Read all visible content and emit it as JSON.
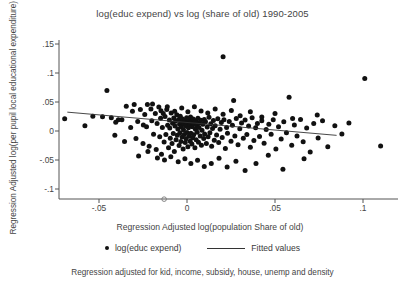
{
  "chart_data": {
    "type": "scatter",
    "title": "log(educ expend) vs log (share of old) 1990-2005",
    "xlabel": "Regression Adjusted log(population Share of old)",
    "ylabel": "Regression Adjusted log(per pupil local educational expenditure)",
    "footnote": "Regression adjusted for kid, income, subsidy, house, unemp and density",
    "xlim": [
      -0.075,
      0.118
    ],
    "ylim": [
      -0.118,
      0.155
    ],
    "xticks": [
      -0.05,
      0,
      0.05,
      0.1
    ],
    "xticklabels": [
      "-.05",
      "0",
      ".05",
      ".1"
    ],
    "yticks": [
      -0.1,
      -0.05,
      0,
      0.05,
      0.1,
      0.15
    ],
    "yticklabels": [
      "-.1",
      "-.05",
      "0",
      ".05",
      ".1",
      ".15"
    ],
    "grid": false,
    "legend_position": "below-axes",
    "marker_color": "#111111",
    "line_color": "#333333",
    "series": [
      {
        "name": "log(educ expend)",
        "marker": "filled-circle",
        "points": [
          [
            -0.0695,
            0.021
          ],
          [
            -0.058,
            0.009
          ],
          [
            -0.0535,
            0.0255
          ],
          [
            -0.048,
            0.0245
          ],
          [
            -0.0455,
            0.07
          ],
          [
            -0.043,
            0.023
          ],
          [
            -0.0405,
            0.015
          ],
          [
            -0.039,
            0.0195
          ],
          [
            -0.037,
            0.0195
          ],
          [
            -0.0345,
            0.0425
          ],
          [
            -0.032,
            0.006
          ],
          [
            -0.03,
            0.0455
          ],
          [
            -0.029,
            -0.013
          ],
          [
            -0.028,
            0.0165
          ],
          [
            -0.0265,
            0.037
          ],
          [
            -0.025,
            -0.0215
          ],
          [
            -0.024,
            0.0285
          ],
          [
            -0.023,
            0.0075
          ],
          [
            -0.0225,
            0.0455
          ],
          [
            -0.0215,
            -0.0265
          ],
          [
            -0.0205,
            0.038
          ],
          [
            -0.02,
            0.0175
          ],
          [
            -0.019,
            -0.0055
          ],
          [
            -0.018,
            0.03
          ],
          [
            -0.0175,
            -0.032
          ],
          [
            -0.017,
            0.013
          ],
          [
            -0.016,
            0.0415
          ],
          [
            -0.0155,
            -0.01
          ],
          [
            -0.015,
            0.022
          ],
          [
            -0.0145,
            -0.04
          ],
          [
            -0.014,
            0.006
          ],
          [
            -0.0135,
            0.03
          ],
          [
            -0.013,
            -0.019
          ],
          [
            -0.0125,
            0.025
          ],
          [
            -0.012,
            -0.006
          ],
          [
            -0.0115,
            0.037
          ],
          [
            -0.011,
            0.01
          ],
          [
            -0.0105,
            -0.029
          ],
          [
            -0.01,
            0.019
          ],
          [
            -0.0098,
            0.005
          ],
          [
            -0.0095,
            -0.0125
          ],
          [
            -0.009,
            0.031
          ],
          [
            -0.0085,
            -0.0215
          ],
          [
            -0.0082,
            0.0135
          ],
          [
            -0.0078,
            -0.0045
          ],
          [
            -0.0075,
            0.0225
          ],
          [
            -0.0072,
            -0.0355
          ],
          [
            -0.0068,
            0.0085
          ],
          [
            -0.0065,
            0.017
          ],
          [
            -0.0062,
            -0.015
          ],
          [
            -0.0058,
            0.028
          ],
          [
            -0.0055,
            -0.0075
          ],
          [
            -0.0052,
            0.0035
          ],
          [
            -0.0048,
            0.02
          ],
          [
            -0.0045,
            -0.025
          ],
          [
            -0.0042,
            0.0115
          ],
          [
            -0.004,
            -0.003
          ],
          [
            -0.0038,
            0.0255
          ],
          [
            -0.0035,
            -0.018
          ],
          [
            -0.0032,
            0.007
          ],
          [
            -0.003,
            0.016
          ],
          [
            -0.0028,
            -0.0105
          ],
          [
            -0.0025,
            0.0205
          ],
          [
            -0.0022,
            -0.031
          ],
          [
            -0.002,
            0.002
          ],
          [
            -0.0018,
            0.0125
          ],
          [
            -0.0015,
            -0.006
          ],
          [
            -0.0012,
            0.018
          ],
          [
            -0.001,
            -0.02
          ],
          [
            -0.0008,
            0.009
          ],
          [
            -0.0005,
            -0.0135
          ],
          [
            -0.0002,
            0.023
          ],
          [
            0.0,
            -0.0025
          ],
          [
            0.0002,
            0.0145
          ],
          [
            0.0005,
            -0.027
          ],
          [
            0.0008,
            0.0055
          ],
          [
            0.001,
            0.0195
          ],
          [
            0.0012,
            -0.009
          ],
          [
            0.0015,
            0.011
          ],
          [
            0.0018,
            -0.0175
          ],
          [
            0.002,
            0.024
          ],
          [
            0.0022,
            -0.004
          ],
          [
            0.0025,
            0.016
          ],
          [
            0.0028,
            -0.0225
          ],
          [
            0.003,
            0.0075
          ],
          [
            0.0032,
            -0.0115
          ],
          [
            0.0035,
            0.0205
          ],
          [
            0.0038,
            -0.0065
          ],
          [
            0.004,
            0.013
          ],
          [
            0.0045,
            -0.029
          ],
          [
            0.0048,
            0.003
          ],
          [
            0.005,
            0.0175
          ],
          [
            0.0052,
            -0.015
          ],
          [
            0.0055,
            0.0095
          ],
          [
            0.0058,
            -0.002
          ],
          [
            0.0062,
            0.022
          ],
          [
            0.0065,
            -0.0195
          ],
          [
            0.0068,
            0.006
          ],
          [
            0.007,
            0.014
          ],
          [
            0.0075,
            -0.0085
          ],
          [
            0.0078,
            0.0185
          ],
          [
            0.0082,
            -0.0245
          ],
          [
            0.0085,
            0.0015
          ],
          [
            0.009,
            0.0115
          ],
          [
            0.0095,
            -0.013
          ],
          [
            0.0098,
            0.02
          ],
          [
            0.01,
            -0.005
          ],
          [
            0.0105,
            0.016
          ],
          [
            0.011,
            -0.0215
          ],
          [
            0.0115,
            0.007
          ],
          [
            0.012,
            -0.01
          ],
          [
            0.0125,
            0.0235
          ],
          [
            0.013,
            -0.003
          ],
          [
            0.0135,
            0.0125
          ],
          [
            0.014,
            -0.0265
          ],
          [
            0.0145,
            0.0045
          ],
          [
            0.015,
            0.018
          ],
          [
            0.0155,
            -0.016
          ],
          [
            0.016,
            0.009
          ],
          [
            0.0168,
            -0.007
          ],
          [
            0.0175,
            0.021
          ],
          [
            0.018,
            -0.02
          ],
          [
            0.0188,
            0.003
          ],
          [
            0.0195,
            0.0145
          ],
          [
            0.02,
            -0.011
          ],
          [
            0.0205,
            0.128
          ],
          [
            0.021,
            0.0195
          ],
          [
            0.0218,
            -0.03
          ],
          [
            0.0225,
            0.006
          ],
          [
            0.023,
            -0.004
          ],
          [
            0.024,
            0.0165
          ],
          [
            0.025,
            -0.0175
          ],
          [
            0.0258,
            0.01
          ],
          [
            0.0265,
            0.0525
          ],
          [
            0.0272,
            -0.0085
          ],
          [
            0.028,
            0.0215
          ],
          [
            0.029,
            -0.0235
          ],
          [
            0.03,
            0.004
          ],
          [
            0.031,
            0.014
          ],
          [
            0.032,
            -0.0125
          ],
          [
            0.033,
            0.019
          ],
          [
            0.034,
            -0.006
          ],
          [
            0.035,
            0.0085
          ],
          [
            0.036,
            -0.028
          ],
          [
            0.037,
            0.023
          ],
          [
            0.038,
            -0.0165
          ],
          [
            0.039,
            0.0055
          ],
          [
            0.04,
            0.013
          ],
          [
            0.0412,
            -0.0095
          ],
          [
            0.0425,
            0.0175
          ],
          [
            0.0438,
            -0.021
          ],
          [
            0.045,
            0.0025
          ],
          [
            0.0465,
            0.0115
          ],
          [
            0.0478,
            -0.0055
          ],
          [
            0.049,
            0.0195
          ],
          [
            0.0505,
            -0.031
          ],
          [
            0.052,
            0.0075
          ],
          [
            0.0535,
            -0.014
          ],
          [
            0.055,
            0.016
          ],
          [
            0.0565,
            -0.003
          ],
          [
            0.058,
            0.058
          ],
          [
            0.0595,
            -0.0245
          ],
          [
            0.061,
            0.0105
          ],
          [
            0.0625,
            -0.0085
          ],
          [
            0.0645,
            0.02
          ],
          [
            0.066,
            -0.0185
          ],
          [
            0.068,
            0.005
          ],
          [
            0.07,
            -0.036
          ],
          [
            0.072,
            0.013
          ],
          [
            0.0745,
            -0.012
          ],
          [
            0.077,
            0.0175
          ],
          [
            0.08,
            -0.027
          ],
          [
            0.084,
            0.009
          ],
          [
            0.088,
            -0.005
          ],
          [
            0.092,
            0.014
          ],
          [
            0.101,
            0.0905
          ],
          [
            0.11,
            -0.026
          ],
          [
            -0.041,
            -0.0075
          ],
          [
            -0.0355,
            -0.018
          ],
          [
            -0.031,
            0.034
          ],
          [
            -0.0275,
            -0.043
          ],
          [
            -0.0248,
            0.0105
          ],
          [
            -0.0222,
            -0.0355
          ],
          [
            -0.0196,
            0.0465
          ],
          [
            -0.0168,
            -0.0465
          ],
          [
            -0.0148,
            0.035
          ],
          [
            -0.0128,
            -0.05
          ],
          [
            -0.0112,
            0.042
          ],
          [
            -0.0092,
            -0.0445
          ],
          [
            -0.007,
            0.034
          ],
          [
            -0.005,
            -0.053
          ],
          [
            -0.003,
            0.0395
          ],
          [
            -0.0012,
            -0.048
          ],
          [
            0.0005,
            0.033
          ],
          [
            0.0022,
            -0.056
          ],
          [
            0.0042,
            0.042
          ],
          [
            0.006,
            -0.0505
          ],
          [
            0.008,
            0.0345
          ],
          [
            0.0098,
            -0.061
          ],
          [
            0.0118,
            0.031
          ],
          [
            0.0138,
            -0.056
          ],
          [
            0.016,
            0.038
          ],
          [
            0.0182,
            -0.047
          ],
          [
            0.0205,
            0.029
          ],
          [
            0.0228,
            -0.062
          ],
          [
            0.0252,
            0.0355
          ],
          [
            0.0278,
            -0.052
          ],
          [
            0.0302,
            0.0265
          ],
          [
            0.033,
            -0.068
          ],
          [
            0.036,
            0.033
          ],
          [
            0.0392,
            -0.056
          ],
          [
            0.0425,
            0.024
          ],
          [
            0.0462,
            -0.042
          ],
          [
            0.05,
            0.03
          ],
          [
            0.0545,
            -0.066
          ],
          [
            0.06,
            0.0215
          ],
          [
            0.0665,
            -0.048
          ],
          [
            0.074,
            0.0275
          ]
        ]
      },
      {
        "name": "outlier-open-marker",
        "marker": "open-circle",
        "points": [
          [
            -0.013,
            -0.1175
          ]
        ]
      }
    ],
    "fitted_line": {
      "name": "Fitted values",
      "x": [
        -0.068,
        0.085
      ],
      "y": [
        0.0325,
        -0.0075
      ]
    }
  },
  "legend": {
    "scatter_label": "log(educ expend)",
    "line_label": "Fitted values"
  }
}
